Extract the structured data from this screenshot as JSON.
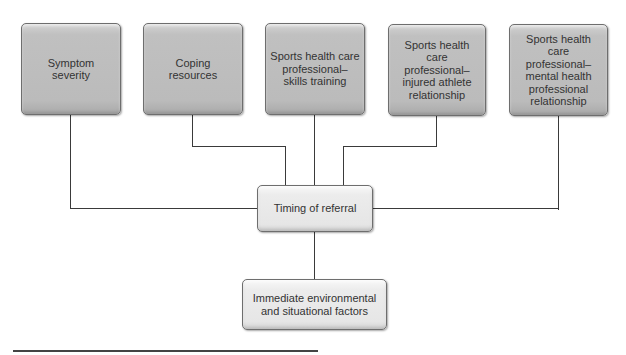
{
  "diagram": {
    "top_nodes": [
      {
        "id": "symptom-severity",
        "label": "Symptom\nseverity"
      },
      {
        "id": "coping-resources",
        "label": "Coping\nresources"
      },
      {
        "id": "skills-training",
        "label": "Sports health care\nprofessional–\nskills training"
      },
      {
        "id": "injured-athlete-relationship",
        "label": "Sports health care\nprofessional–\ninjured athlete\nrelationship"
      },
      {
        "id": "mental-health-professional-relationship",
        "label": "Sports health care\nprofessional–\nmental health\nprofessional\nrelationship"
      }
    ],
    "center_node": {
      "id": "timing-of-referral",
      "label": "Timing of referral"
    },
    "bottom_node": {
      "id": "environmental-situational-factors",
      "label": "Immediate environmental\nand situational factors"
    },
    "edges": [
      {
        "from": "symptom-severity",
        "to": "timing-of-referral"
      },
      {
        "from": "coping-resources",
        "to": "timing-of-referral"
      },
      {
        "from": "skills-training",
        "to": "timing-of-referral"
      },
      {
        "from": "injured-athlete-relationship",
        "to": "timing-of-referral"
      },
      {
        "from": "mental-health-professional-relationship",
        "to": "timing-of-referral"
      },
      {
        "from": "timing-of-referral",
        "to": "environmental-situational-factors"
      }
    ],
    "colors": {
      "top_box_fill": "#bdbdbd",
      "center_box_fill": "#ececec",
      "line": "#3a3a3a",
      "text": "#333333"
    }
  }
}
